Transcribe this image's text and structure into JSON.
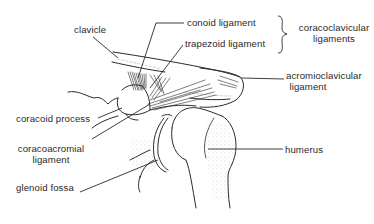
{
  "diagram": {
    "colors": {
      "ink": "#2a2a2a",
      "stipple": "#8a8a8a",
      "background": "#ffffff"
    },
    "labels": {
      "clavicle": "clavicle",
      "conoid_ligament": "conoid ligament",
      "trapezoid_ligament": "trapezoid ligament",
      "coracoclavicular_ligaments_line1": "coracoclavicular",
      "coracoclavicular_ligaments_line2": "ligaments",
      "acromioclavicular_ligament_line1": "acromioclavicular",
      "acromioclavicular_ligament_line2": "ligament",
      "coracoid_process": "coracoid process",
      "coracoacromial_ligament_line1": "coracoacromial",
      "coracoacromial_ligament_line2": "ligament",
      "humerus": "humerus",
      "glenoid_fossa": "glenoid fossa"
    },
    "groups": [
      {
        "name": "coracoclavicular ligaments",
        "members": [
          "conoid ligament",
          "trapezoid ligament"
        ]
      }
    ]
  }
}
